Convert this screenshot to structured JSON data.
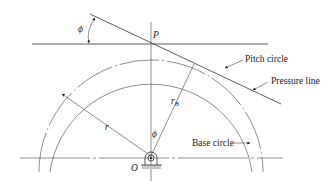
{
  "diagram": {
    "labels": {
      "phi_top": "ϕ",
      "P": "P",
      "pitch_circle": "Pitch circle",
      "pressure_line": "Pressure line",
      "r": "r",
      "r_B": "r",
      "r_B_sub": "B",
      "phi_center": "ϕ",
      "O": "O",
      "base_circle": "Base circle"
    },
    "geometry": {
      "center_O": [
        151,
        156
      ],
      "pitch_radius": 112,
      "base_radius": 102,
      "point_P": [
        151,
        44
      ],
      "pressure_line": [
        [
          90,
          14
        ],
        [
          281,
          104
        ]
      ],
      "pitch_line_horizontal": [
        [
          32,
          44
        ],
        [
          268,
          44
        ]
      ],
      "center_line_horizontal": [
        [
          20,
          158
        ],
        [
          283,
          158
        ]
      ]
    },
    "colors": {
      "line": "#333333",
      "ground": "#c8c8c8",
      "background": "#ffffff"
    }
  }
}
